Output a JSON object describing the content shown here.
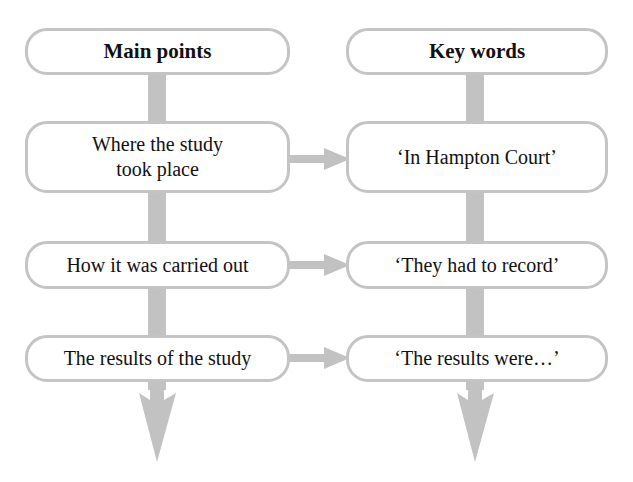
{
  "colors": {
    "connector": "#c2c2c2",
    "box_border": "#c4c4c4",
    "box_fill": "#ffffff",
    "text": "#111111"
  },
  "columns": {
    "left": {
      "header": "Main points",
      "items": [
        {
          "line1": "Where the study",
          "line2": "took place"
        },
        {
          "line1": "How it was carried out"
        },
        {
          "line1": "The results of the study"
        }
      ]
    },
    "right": {
      "header": "Key words",
      "items": [
        {
          "line1": "‘In Hampton Court’"
        },
        {
          "line1": "‘They had to record’"
        },
        {
          "line1": "‘The results were…’"
        }
      ]
    }
  }
}
